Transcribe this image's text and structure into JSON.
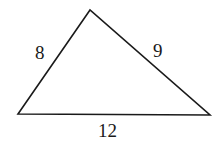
{
  "diagram": {
    "type": "triangle",
    "vertices": {
      "top": [
        90,
        10
      ],
      "bottom_left": [
        18,
        114
      ],
      "bottom_right": [
        210,
        115
      ]
    },
    "sides": [
      {
        "name": "left",
        "label": "8"
      },
      {
        "name": "right",
        "label": "9"
      },
      {
        "name": "bottom",
        "label": "12"
      }
    ],
    "stroke_color": "#1a1a1a"
  }
}
